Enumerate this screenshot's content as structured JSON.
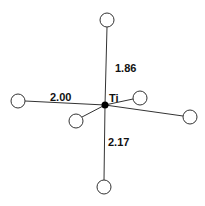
{
  "diagram": {
    "type": "coordination-geometry",
    "center": {
      "label": "Ti",
      "x": 105,
      "y": 105,
      "r": 3.5,
      "color": "#000000"
    },
    "ligands": [
      {
        "id": "top",
        "x": 107,
        "y": 20,
        "r": 7
      },
      {
        "id": "left",
        "x": 18,
        "y": 101,
        "r": 7
      },
      {
        "id": "lower-left",
        "x": 76,
        "y": 121,
        "r": 7
      },
      {
        "id": "near-right",
        "x": 140,
        "y": 98,
        "r": 7
      },
      {
        "id": "far-right",
        "x": 190,
        "y": 117,
        "r": 7
      },
      {
        "id": "bottom",
        "x": 104,
        "y": 187,
        "r": 7
      }
    ],
    "bond_lengths": [
      {
        "bond": "top",
        "value": "1.86",
        "x": 115,
        "y": 72
      },
      {
        "bond": "left",
        "value": "2.00",
        "x": 50,
        "y": 101
      },
      {
        "bond": "bottom",
        "value": "2.17",
        "x": 108,
        "y": 146
      }
    ],
    "center_label": {
      "text": "Ti",
      "x": 109,
      "y": 102
    }
  }
}
